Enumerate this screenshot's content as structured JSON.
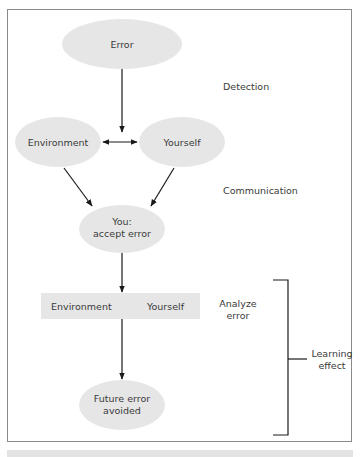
{
  "diagram": {
    "nodes": {
      "error": {
        "label": "Error"
      },
      "environment": {
        "label": "Environment"
      },
      "yourself": {
        "label": "Yourself"
      },
      "you_accept": {
        "line1": "You:",
        "line2": "accept error"
      },
      "analyze_box": {
        "left_label": "Environment",
        "right_label": "Yourself"
      },
      "future": {
        "line1": "Future error",
        "line2": "avoided"
      }
    },
    "stages": {
      "detection": "Detection",
      "communication": "Communication",
      "analyze": {
        "line1": "Analyze",
        "line2": "error"
      },
      "learning": {
        "line1": "Learning",
        "line2": "effect"
      }
    },
    "colors": {
      "node_fill": "#e6e6e6",
      "line": "#1a1a1a",
      "frame": "#8a8a8a",
      "text": "#3a3a3a"
    }
  }
}
